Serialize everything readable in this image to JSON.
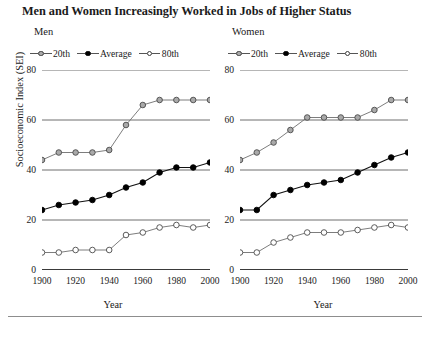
{
  "title": "Men and Women Increasingly Worked in Jobs of Higher Status",
  "axis": {
    "ylabel": "Socioeconomic Index (SEI)",
    "xlabel": "Year",
    "yticks": [
      0,
      20,
      40,
      60,
      80
    ],
    "xticks": [
      1900,
      1920,
      1940,
      1960,
      1980,
      2000
    ],
    "xminor": [
      1910,
      1930,
      1950,
      1970,
      1990
    ],
    "ylim": [
      0,
      80
    ],
    "xlim": [
      1900,
      2000
    ]
  },
  "legend": {
    "items": [
      {
        "label": "20th",
        "marker": "gray-filled-circle",
        "color": "#a9a9a9"
      },
      {
        "label": "Average",
        "marker": "black-filled-circle",
        "color": "#000000"
      },
      {
        "label": "80th",
        "marker": "open-circle",
        "color": "#ffffff"
      }
    ]
  },
  "panels": [
    {
      "id": "men",
      "title": "Men"
    },
    {
      "id": "women",
      "title": "Women"
    }
  ],
  "chart_data": [
    {
      "type": "line",
      "title": "Men",
      "xlabel": "Year",
      "ylabel": "Socioeconomic Index (SEI)",
      "xlim": [
        1900,
        2000
      ],
      "ylim": [
        0,
        80
      ],
      "grid": "horizontal",
      "legend_position": "top-left",
      "x": [
        1900,
        1910,
        1920,
        1930,
        1940,
        1950,
        1960,
        1970,
        1980,
        1990,
        2000
      ],
      "series": [
        {
          "name": "20th",
          "color": "#a9a9a9",
          "values": [
            44,
            47,
            47,
            47,
            48,
            58,
            66,
            68,
            68,
            68,
            68
          ]
        },
        {
          "name": "Average",
          "color": "#000000",
          "values": [
            24,
            26,
            27,
            28,
            30,
            33,
            35,
            39,
            41,
            41,
            43
          ]
        },
        {
          "name": "80th",
          "color": "#ffffff",
          "values": [
            7,
            7,
            8,
            8,
            8,
            14,
            15,
            17,
            18,
            17,
            18
          ]
        }
      ]
    },
    {
      "type": "line",
      "title": "Women",
      "xlabel": "Year",
      "ylabel": "Socioeconomic Index (SEI)",
      "xlim": [
        1900,
        2000
      ],
      "ylim": [
        0,
        80
      ],
      "grid": "horizontal",
      "legend_position": "top-left",
      "x": [
        1900,
        1910,
        1920,
        1930,
        1940,
        1950,
        1960,
        1970,
        1980,
        1990,
        2000
      ],
      "series": [
        {
          "name": "20th",
          "color": "#a9a9a9",
          "values": [
            44,
            47,
            51,
            56,
            61,
            61,
            61,
            61,
            64,
            68,
            68
          ]
        },
        {
          "name": "Average",
          "color": "#000000",
          "values": [
            24,
            24,
            30,
            32,
            34,
            35,
            36,
            39,
            42,
            45,
            47
          ]
        },
        {
          "name": "80th",
          "color": "#ffffff",
          "values": [
            7,
            7,
            11,
            13,
            15,
            15,
            15,
            16,
            17,
            18,
            17
          ]
        }
      ]
    }
  ]
}
